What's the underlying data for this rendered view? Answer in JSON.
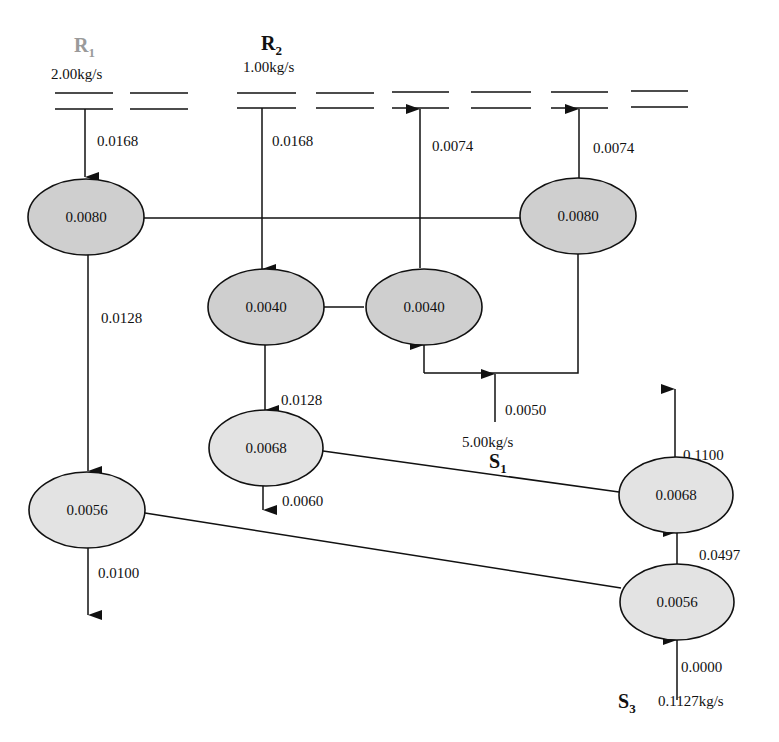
{
  "diagram": {
    "type": "water-allocation-network",
    "sources": [
      {
        "id": "R1",
        "label": "R",
        "subscript": "1",
        "flow": "2.00kg/s",
        "faded": true
      },
      {
        "id": "R2",
        "label": "R",
        "subscript": "2",
        "flow": "1.00kg/s",
        "faded": false
      },
      {
        "id": "S1",
        "label": "S",
        "subscript": "1",
        "flow": "5.00kg/s",
        "faded": false
      },
      {
        "id": "S3",
        "label": "S",
        "subscript": "3",
        "flow": "0.1127kg/s",
        "faded": false
      }
    ],
    "nodes": [
      {
        "id": "n1",
        "value": "0.0080",
        "shade": "dark"
      },
      {
        "id": "n2",
        "value": "0.0080",
        "shade": "dark"
      },
      {
        "id": "n3",
        "value": "0.0040",
        "shade": "dark"
      },
      {
        "id": "n4",
        "value": "0.0040",
        "shade": "dark"
      },
      {
        "id": "n5",
        "value": "0.0068",
        "shade": "light"
      },
      {
        "id": "n6",
        "value": "0.0056",
        "shade": "light"
      },
      {
        "id": "n7",
        "value": "0.0068",
        "shade": "light"
      },
      {
        "id": "n8",
        "value": "0.0056",
        "shade": "light"
      }
    ],
    "edges": [
      {
        "from": "R1",
        "to": "n1",
        "label": "0.0168"
      },
      {
        "from": "R2",
        "to": "n3",
        "label": "0.0168"
      },
      {
        "from": "n4",
        "to": "header",
        "label": "0.0074"
      },
      {
        "from": "n2",
        "to": "header",
        "label": "0.0074"
      },
      {
        "from": "n1",
        "to": "n6",
        "label": "0.0128"
      },
      {
        "from": "n3",
        "to": "n5",
        "label": "0.0128"
      },
      {
        "from": "n5",
        "to": "out",
        "label": "0.0060"
      },
      {
        "from": "S1",
        "to": "n4",
        "label": "0.0050"
      },
      {
        "from": "n7",
        "to": "out",
        "label": "0.1100"
      },
      {
        "from": "n8",
        "to": "n7",
        "label": "0.0497"
      },
      {
        "from": "n6",
        "to": "out",
        "label": "0.0100"
      },
      {
        "from": "S3",
        "to": "n8",
        "label": "0.0000"
      }
    ]
  }
}
